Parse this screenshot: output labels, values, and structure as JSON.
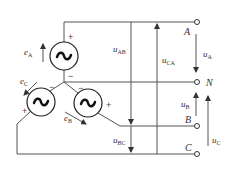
{
  "diagram": {
    "sources": [
      {
        "id": "A",
        "emf_label": "e",
        "emf_sub": "A",
        "plus": "+",
        "minus": "−",
        "symbol": "~"
      },
      {
        "id": "B",
        "emf_label": "e",
        "emf_sub": "B",
        "plus": "+",
        "minus": "−",
        "symbol": "~"
      },
      {
        "id": "C",
        "emf_label": "e",
        "emf_sub": "C",
        "plus": "+",
        "minus": "−",
        "symbol": "~"
      }
    ],
    "terminals": [
      {
        "id": "A",
        "label": "A"
      },
      {
        "id": "N",
        "label": "N"
      },
      {
        "id": "B",
        "label": "B"
      },
      {
        "id": "C",
        "label": "C"
      }
    ],
    "line_voltages": [
      {
        "label": "u",
        "sub": "AB"
      },
      {
        "label": "u",
        "sub": "BC"
      },
      {
        "label": "u",
        "sub": "CA"
      }
    ],
    "phase_voltages": [
      {
        "label": "u",
        "sub": "A"
      },
      {
        "label": "u",
        "sub": "B"
      },
      {
        "label": "u",
        "sub": "C"
      }
    ],
    "colors": {
      "line": "#444444",
      "text": "#333333",
      "background": "#ffffff"
    }
  }
}
